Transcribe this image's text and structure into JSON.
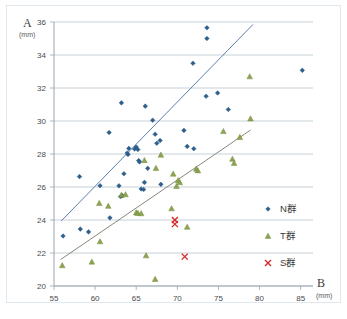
{
  "chart_data": {
    "type": "scatter",
    "title": "",
    "xlabel": "B",
    "xunit": "(mm)",
    "ylabel": "A",
    "yunit": "(mm)",
    "xlim": [
      55,
      86.5
    ],
    "ylim": [
      20,
      36
    ],
    "xticks": [
      55,
      60,
      65,
      70,
      75,
      80,
      85
    ],
    "yticks": [
      20,
      22,
      24,
      26,
      28,
      30,
      32,
      34,
      36
    ],
    "grid": "horizontal",
    "legend_position": "right-inside",
    "series": [
      {
        "name": "N群",
        "marker": "diamond",
        "color": "#2e5f8a",
        "points": [
          [
            56.1,
            23.03
          ],
          [
            58.2,
            23.45
          ],
          [
            58.1,
            26.63
          ],
          [
            59.2,
            23.28
          ],
          [
            60.6,
            26.08
          ],
          [
            61.7,
            29.3
          ],
          [
            61.8,
            24.13
          ],
          [
            62.9,
            26.07
          ],
          [
            63.2,
            31.1
          ],
          [
            63.1,
            25.42
          ],
          [
            63.3,
            25.48
          ],
          [
            63.5,
            26.8
          ],
          [
            63.9,
            28.06
          ],
          [
            64.0,
            27.97
          ],
          [
            64.1,
            28.34
          ],
          [
            64.8,
            28.3
          ],
          [
            65.0,
            28.42
          ],
          [
            65.2,
            28.27
          ],
          [
            65.3,
            27.6
          ],
          [
            65.4,
            27.52
          ],
          [
            65.6,
            25.88
          ],
          [
            65.9,
            25.85
          ],
          [
            66.0,
            26.28
          ],
          [
            66.1,
            30.9
          ],
          [
            66.4,
            27.13
          ],
          [
            67.0,
            30.05
          ],
          [
            67.3,
            29.2
          ],
          [
            67.5,
            28.65
          ],
          [
            67.9,
            28.82
          ],
          [
            68.0,
            26.16
          ],
          [
            70.8,
            29.43
          ],
          [
            71.2,
            28.46
          ],
          [
            72.0,
            28.32
          ],
          [
            71.9,
            33.5
          ],
          [
            73.6,
            35.65
          ],
          [
            73.6,
            35.0
          ],
          [
            73.5,
            31.5
          ],
          [
            74.9,
            31.7
          ],
          [
            76.2,
            30.7
          ],
          [
            85.2,
            33.07
          ]
        ]
      },
      {
        "name": "T群",
        "marker": "triangle",
        "color": "#8aa04a",
        "points": [
          [
            56.0,
            21.25
          ],
          [
            59.6,
            21.47
          ],
          [
            60.6,
            22.7
          ],
          [
            60.5,
            25.02
          ],
          [
            61.6,
            24.85
          ],
          [
            63.2,
            25.52
          ],
          [
            63.7,
            25.55
          ],
          [
            65.0,
            24.45
          ],
          [
            65.2,
            24.42
          ],
          [
            65.6,
            24.4
          ],
          [
            66.0,
            27.62
          ],
          [
            66.2,
            21.85
          ],
          [
            67.3,
            20.42
          ],
          [
            67.4,
            27.15
          ],
          [
            68.0,
            27.95
          ],
          [
            69.3,
            24.7
          ],
          [
            69.5,
            26.8
          ],
          [
            69.9,
            26.05
          ],
          [
            70.1,
            26.4
          ],
          [
            70.3,
            26.28
          ],
          [
            71.2,
            23.58
          ],
          [
            72.3,
            27.1
          ],
          [
            72.5,
            27.0
          ],
          [
            75.6,
            29.38
          ],
          [
            76.7,
            27.7
          ],
          [
            76.9,
            27.45
          ],
          [
            77.6,
            29.02
          ],
          [
            78.8,
            32.7
          ],
          [
            78.9,
            30.15
          ]
        ]
      },
      {
        "name": "S群",
        "marker": "cross",
        "color": "#d62b2b",
        "points": [
          [
            69.7,
            24.0
          ],
          [
            69.7,
            23.75
          ],
          [
            70.9,
            21.78
          ]
        ]
      }
    ],
    "trendlines": [
      {
        "name": "N群-trend",
        "color": "#4a6fa5",
        "x0": 55.9,
        "y0": 23.95,
        "x1": 79.2,
        "y1": 35.85
      },
      {
        "name": "T群-trend",
        "color": "#7a7a6a",
        "x0": 55.8,
        "y0": 21.6,
        "x1": 78.9,
        "y1": 29.45
      }
    ]
  },
  "legend": {
    "items": [
      {
        "label": "N群",
        "marker": "diamond",
        "color": "#2e5f8a"
      },
      {
        "label": "T群",
        "marker": "triangle",
        "color": "#8aa04a"
      },
      {
        "label": "S群",
        "marker": "cross",
        "color": "#d62b2b"
      }
    ]
  },
  "axes": {
    "y_title": "A",
    "y_unit": "(mm)",
    "x_title": "B",
    "x_unit": "(mm)"
  },
  "colors": {
    "n_group": "#2e5f8a",
    "t_group": "#8aa04a",
    "s_group": "#d62b2b",
    "gridline": "#b8c4cf",
    "axis": "#9aa6b2",
    "frame": "#dfe7ef",
    "tick_text": "#4a4a4a"
  }
}
